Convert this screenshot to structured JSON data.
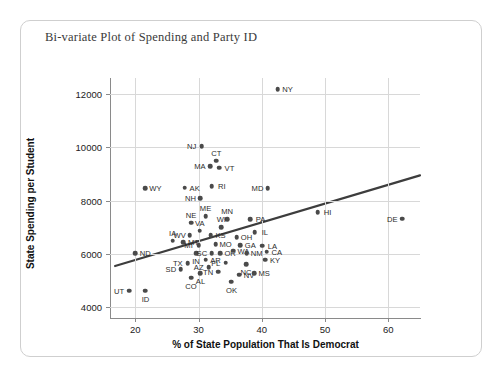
{
  "chart_data": {
    "type": "scatter",
    "title": "Bi-variate Plot of Spending and Party ID",
    "xlabel": "% of State Population That Is Democrat",
    "ylabel": "State Spending per Student",
    "xlim": [
      16,
      65
    ],
    "ylim": [
      3600,
      12600
    ],
    "xticks": [
      20,
      30,
      40,
      50,
      60
    ],
    "yticks": [
      4000,
      6000,
      8000,
      10000,
      12000
    ],
    "grid": true,
    "legend": "none",
    "point_color": "#4a4a4a",
    "trendline_color": "#3d3d3d",
    "trendline": {
      "x0": 16.8,
      "y0": 5550,
      "x1": 65.0,
      "y1": 8950
    },
    "points": [
      {
        "label": "NY",
        "x": 42.5,
        "y": 12180,
        "lx": "right"
      },
      {
        "label": "NJ",
        "x": 30.5,
        "y": 10040,
        "lx": "left"
      },
      {
        "label": "CT",
        "x": 32.8,
        "y": 9500,
        "lx": "top"
      },
      {
        "label": "MA",
        "x": 31.8,
        "y": 9290,
        "lx": "left"
      },
      {
        "label": "VT",
        "x": 33.3,
        "y": 9230,
        "lx": "right"
      },
      {
        "label": "RI",
        "x": 32.1,
        "y": 8550,
        "lx": "right"
      },
      {
        "label": "MD",
        "x": 40.9,
        "y": 8470,
        "lx": "left"
      },
      {
        "label": "WY",
        "x": 21.6,
        "y": 8460,
        "lx": "right"
      },
      {
        "label": "AK",
        "x": 27.8,
        "y": 8480,
        "lx": "right"
      },
      {
        "label": "NH",
        "x": 30.3,
        "y": 8100,
        "lx": "left"
      },
      {
        "label": "HI",
        "x": 48.8,
        "y": 7560,
        "lx": "right"
      },
      {
        "label": "DE",
        "x": 62.2,
        "y": 7320,
        "lx": "left"
      },
      {
        "label": "ME",
        "x": 31.1,
        "y": 7420,
        "lx": "top"
      },
      {
        "label": "NE",
        "x": 28.8,
        "y": 7180,
        "lx": "top"
      },
      {
        "label": "MN",
        "x": 34.5,
        "y": 7300,
        "lx": "top"
      },
      {
        "label": "PA",
        "x": 38.2,
        "y": 7300,
        "lx": "right"
      },
      {
        "label": "WI",
        "x": 33.6,
        "y": 7000,
        "lx": "top"
      },
      {
        "label": "VA",
        "x": 30.2,
        "y": 6880,
        "lx": "top"
      },
      {
        "label": "IL",
        "x": 38.9,
        "y": 6820,
        "lx": "right"
      },
      {
        "label": "WV",
        "x": 28.6,
        "y": 6700,
        "lx": "left"
      },
      {
        "label": "KS",
        "x": 31.9,
        "y": 6700,
        "lx": "right"
      },
      {
        "label": "OH",
        "x": 36.0,
        "y": 6640,
        "lx": "right"
      },
      {
        "label": "IA",
        "x": 25.9,
        "y": 6500,
        "lx": "top"
      },
      {
        "label": "MT",
        "x": 27.6,
        "y": 6450,
        "lx": "right"
      },
      {
        "label": "MI",
        "x": 30.0,
        "y": 6330,
        "lx": "left"
      },
      {
        "label": "MO",
        "x": 32.7,
        "y": 6360,
        "lx": "right"
      },
      {
        "label": "GA",
        "x": 36.6,
        "y": 6340,
        "lx": "right"
      },
      {
        "label": "LA",
        "x": 40.1,
        "y": 6310,
        "lx": "right"
      },
      {
        "label": "ND",
        "x": 20.0,
        "y": 6030,
        "lx": "right"
      },
      {
        "label": "IN",
        "x": 29.6,
        "y": 6020,
        "lx": "bottom"
      },
      {
        "label": "SC",
        "x": 32.1,
        "y": 6020,
        "lx": "left"
      },
      {
        "label": "OR",
        "x": 33.4,
        "y": 6020,
        "lx": "right"
      },
      {
        "label": "WA",
        "x": 35.5,
        "y": 6120,
        "lx": "right"
      },
      {
        "label": "NM",
        "x": 37.6,
        "y": 6040,
        "lx": "right"
      },
      {
        "label": "CA",
        "x": 40.8,
        "y": 6080,
        "lx": "right"
      },
      {
        "label": "KY",
        "x": 40.5,
        "y": 5790,
        "lx": "right"
      },
      {
        "label": "AR",
        "x": 31.1,
        "y": 5780,
        "lx": "right"
      },
      {
        "label": "TX",
        "x": 28.3,
        "y": 5660,
        "lx": "left"
      },
      {
        "label": "FL",
        "x": 34.3,
        "y": 5680,
        "lx": "left"
      },
      {
        "label": "NC",
        "x": 37.5,
        "y": 5620,
        "lx": "bottom"
      },
      {
        "label": "AZ",
        "x": 31.6,
        "y": 5510,
        "lx": "left"
      },
      {
        "label": "SD",
        "x": 27.2,
        "y": 5440,
        "lx": "left"
      },
      {
        "label": "AL",
        "x": 30.3,
        "y": 5280,
        "lx": "bottom"
      },
      {
        "label": "TN",
        "x": 33.1,
        "y": 5330,
        "lx": "left"
      },
      {
        "label": "NV",
        "x": 36.4,
        "y": 5230,
        "lx": "right"
      },
      {
        "label": "MS",
        "x": 38.8,
        "y": 5280,
        "lx": "right"
      },
      {
        "label": "CO",
        "x": 28.8,
        "y": 5110,
        "lx": "bottom"
      },
      {
        "label": "OK",
        "x": 35.2,
        "y": 4960,
        "lx": "bottom"
      },
      {
        "label": "UT",
        "x": 19.0,
        "y": 4620,
        "lx": "left"
      },
      {
        "label": "ID",
        "x": 21.6,
        "y": 4620,
        "lx": "bottom"
      }
    ]
  }
}
